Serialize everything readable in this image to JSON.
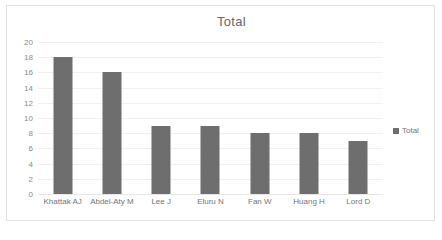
{
  "chart": {
    "title": "Total",
    "legend": {
      "position": "right",
      "entries": [
        {
          "label": "Total",
          "color": "#6e6e6e",
          "marker": "square-marker"
        }
      ]
    },
    "colors": {
      "bar": "#6e6e6e",
      "gridline": "#f0f0f0",
      "border": "#e2e2e2",
      "text": "#757575",
      "title_text": "#676767",
      "background": "#ffffff"
    }
  },
  "chart_data": {
    "type": "bar",
    "title": "Total",
    "xlabel": "",
    "ylabel": "",
    "ylim": [
      0,
      20
    ],
    "ytick_step": 2,
    "yticks": [
      0,
      2,
      4,
      6,
      8,
      10,
      12,
      14,
      16,
      18,
      20
    ],
    "ytick_labels": [
      "0",
      "2",
      "4",
      "6",
      "8",
      "10",
      "12",
      "14",
      "16",
      "18",
      "20"
    ],
    "grid": true,
    "grid_axis": "y",
    "legend_position": "right",
    "categories": [
      "Khattak AJ",
      "Abdel-Aty M",
      "Lee J",
      "Eluru N",
      "Fan W",
      "Huang H",
      "Lord D"
    ],
    "series": [
      {
        "name": "Total",
        "color": "#6e6e6e",
        "values": [
          18,
          16,
          9,
          9,
          8,
          8,
          7
        ]
      }
    ]
  }
}
